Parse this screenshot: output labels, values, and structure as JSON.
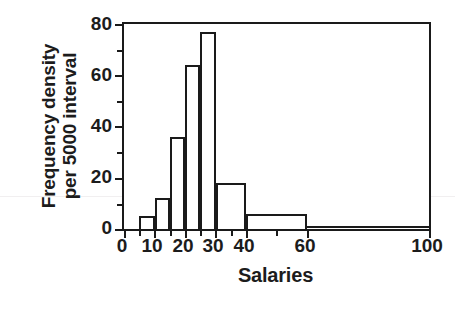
{
  "chart_data": {
    "type": "bar",
    "title": "",
    "subtitle": "",
    "xlabel": "Salaries",
    "ylabel": "Frequency density per 5000 interval",
    "ylabel_lines": [
      "Frequency density",
      "per 5000 interval"
    ],
    "xlim": [
      0,
      100
    ],
    "ylim": [
      0,
      80
    ],
    "grid": false,
    "legend": null,
    "x_major_ticks": [
      0,
      10,
      20,
      30,
      40,
      60,
      100
    ],
    "x_minor_ticks": [
      5,
      15,
      25,
      35,
      50
    ],
    "x_tick_labels": [
      "0",
      "10",
      "20",
      "30",
      "40",
      "60",
      "100"
    ],
    "y_major_ticks": [
      0,
      20,
      40,
      60,
      80
    ],
    "y_minor_ticks": [
      10,
      30,
      50,
      70
    ],
    "y_tick_labels": [
      "0",
      "20",
      "40",
      "60",
      "80"
    ],
    "bin_edges": [
      0,
      5,
      10,
      15,
      20,
      25,
      30,
      40,
      60,
      100
    ],
    "bins": [
      {
        "label": "0–5",
        "x0": 0,
        "x1": 5,
        "value": 0
      },
      {
        "label": "5–10",
        "x0": 5,
        "x1": 10,
        "value": 5
      },
      {
        "label": "10–15",
        "x0": 10,
        "x1": 15,
        "value": 12
      },
      {
        "label": "15–20",
        "x0": 15,
        "x1": 20,
        "value": 36
      },
      {
        "label": "20–25",
        "x0": 20,
        "x1": 25,
        "value": 64
      },
      {
        "label": "25–30",
        "x0": 25,
        "x1": 30,
        "value": 77
      },
      {
        "label": "30–40",
        "x0": 30,
        "x1": 40,
        "value": 18
      },
      {
        "label": "40–60",
        "x0": 40,
        "x1": 60,
        "value": 6
      },
      {
        "label": "60–100",
        "x0": 60,
        "x1": 100,
        "value": 1
      }
    ],
    "categories": [
      "0–5",
      "5–10",
      "10–15",
      "15–20",
      "20–25",
      "25–30",
      "30–40",
      "40–60",
      "60–100"
    ],
    "values": [
      0,
      5,
      12,
      36,
      64,
      77,
      18,
      6,
      1
    ],
    "colors": {
      "axis": "#1a1a1a",
      "bar_outline": "#1a1a1a",
      "bar_fill": "#ffffff",
      "text": "#1c1c1c",
      "background": "#ffffff"
    }
  }
}
